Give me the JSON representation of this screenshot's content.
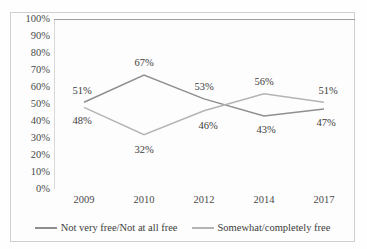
{
  "chart_data": {
    "type": "line",
    "title": "",
    "xlabel": "",
    "ylabel": "",
    "categories": [
      "2009",
      "2010",
      "2012",
      "2014",
      "2017"
    ],
    "ylim": [
      0,
      100
    ],
    "ytick_labels": [
      "100%",
      "90%",
      "80%",
      "70%",
      "60%",
      "50%",
      "40%",
      "30%",
      "20%",
      "10%",
      "0%"
    ],
    "ytick_values": [
      100,
      90,
      80,
      70,
      60,
      50,
      40,
      30,
      20,
      10,
      0
    ],
    "grid": false,
    "legend_position": "bottom",
    "series": [
      {
        "name": "Not very free/Not at all free",
        "color": "#8f8f8f",
        "values": [
          51,
          67,
          53,
          43,
          47
        ],
        "labels": [
          "51%",
          "67%",
          "53%",
          "43%",
          "47%"
        ]
      },
      {
        "name": "Somewhat/completely free",
        "color": "#b4b4b4",
        "values": [
          48,
          32,
          46,
          56,
          51
        ],
        "labels": [
          "48%",
          "32%",
          "46%",
          "56%",
          "51%"
        ]
      }
    ]
  },
  "legend": {
    "items": [
      {
        "label": "Not very free/Not at all free",
        "color": "#8f8f8f"
      },
      {
        "label": "Somewhat/completely free",
        "color": "#b4b4b4"
      }
    ]
  }
}
